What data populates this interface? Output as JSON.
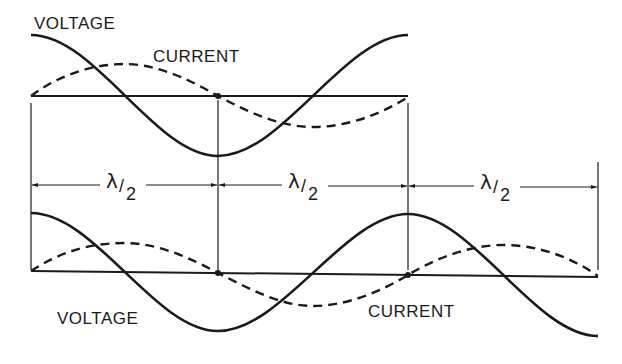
{
  "diagram": {
    "colors": {
      "ink": "#1a1a1a",
      "background": "#ffffff"
    },
    "top_panel": {
      "voltage_label": "VOLTAGE",
      "current_label": "CURRENT",
      "voltage_style": "solid",
      "current_style": "dashed",
      "length": "λ/2 x 2"
    },
    "dimension_row": {
      "segments": [
        {
          "symbol": "λ",
          "slash": "/",
          "denominator": "2"
        },
        {
          "symbol": "λ",
          "slash": "/",
          "denominator": "2"
        },
        {
          "symbol": "λ",
          "slash": "/",
          "denominator": "2"
        }
      ]
    },
    "bottom_panel": {
      "voltage_label": "VOLTAGE",
      "current_label": "CURRENT",
      "voltage_style": "solid",
      "current_style": "dashed"
    }
  }
}
